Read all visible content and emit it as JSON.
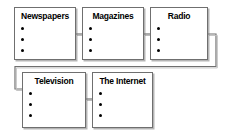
{
  "diagram": {
    "type": "flowchart",
    "flow_direction": "serpentine-left-to-right-then-wrap",
    "stroke_color": "#6f6f6f",
    "text_color": "#000000",
    "background_color": "#ffffff",
    "nodes": [
      {
        "id": "newspapers",
        "label": "Newspapers",
        "bullets": [
          "",
          "",
          ""
        ],
        "bullet_count": 3,
        "row": 1,
        "column": 1
      },
      {
        "id": "magazines",
        "label": "Magazines",
        "bullets": [
          "",
          "",
          ""
        ],
        "bullet_count": 3,
        "row": 1,
        "column": 2
      },
      {
        "id": "radio",
        "label": "Radio",
        "bullets": [
          "",
          "",
          ""
        ],
        "bullet_count": 3,
        "row": 1,
        "column": 3
      },
      {
        "id": "television",
        "label": "Television",
        "bullets": [
          "",
          "",
          ""
        ],
        "bullet_count": 3,
        "row": 2,
        "column": 1
      },
      {
        "id": "internet",
        "label": "The Internet",
        "bullets": [
          "",
          "",
          ""
        ],
        "bullet_count": 3,
        "row": 2,
        "column": 2
      }
    ],
    "connectors": [
      {
        "id": "newspapers-to-magazines",
        "from": "newspapers",
        "to": "magazines",
        "style": "straight-horizontal"
      },
      {
        "id": "magazines-to-radio",
        "from": "magazines",
        "to": "radio",
        "style": "straight-horizontal"
      },
      {
        "id": "radio-to-television",
        "from": "radio",
        "to": "television",
        "style": "elbow-wrap-around"
      },
      {
        "id": "television-to-internet",
        "from": "television",
        "to": "internet",
        "style": "straight-horizontal"
      }
    ]
  }
}
